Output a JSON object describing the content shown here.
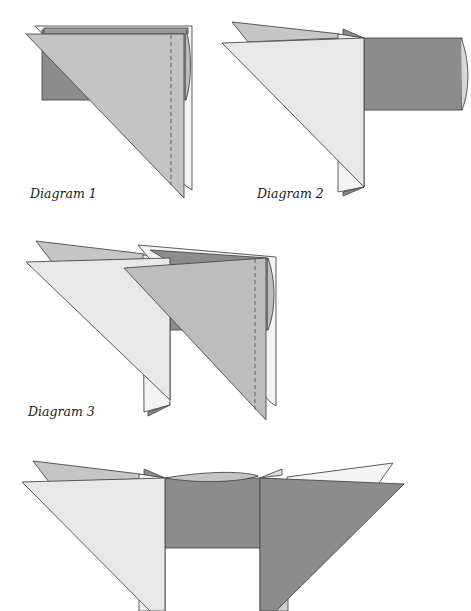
{
  "page": {
    "type": "instructional folding diagram sequence"
  },
  "colors": {
    "light_paper": "#e8e8e8",
    "white_paper": "#f3f3f3",
    "medium_paper": "#bdbdbd",
    "dark_paper": "#8c8c8c",
    "flap_gray": "#c6c6c6",
    "outline": "#4a4a4a",
    "fold_line": "#555555"
  },
  "diagrams": [
    {
      "id": 1,
      "label": "Diagram 1",
      "fold_line": "dashed vertical"
    },
    {
      "id": 2,
      "label": "Diagram 2"
    },
    {
      "id": 3,
      "label": "Diagram 3",
      "fold_line": "dashed vertical"
    },
    {
      "id": 4,
      "label": ""
    }
  ]
}
